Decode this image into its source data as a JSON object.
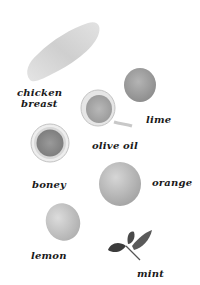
{
  "scene": {
    "title": "Ingredients",
    "background": "#ffffff"
  },
  "ingredients": [
    {
      "name": "chicken",
      "label_line1": "chicken",
      "label_line2": "breast"
    },
    {
      "name": "lime",
      "label": "lime"
    },
    {
      "name": "olive-oil",
      "label": "olive oil"
    },
    {
      "name": "honey",
      "label": "boney"
    },
    {
      "name": "orange",
      "label": "orange"
    },
    {
      "name": "lemon",
      "label": "lemon"
    },
    {
      "name": "mint",
      "label": "mint"
    }
  ]
}
